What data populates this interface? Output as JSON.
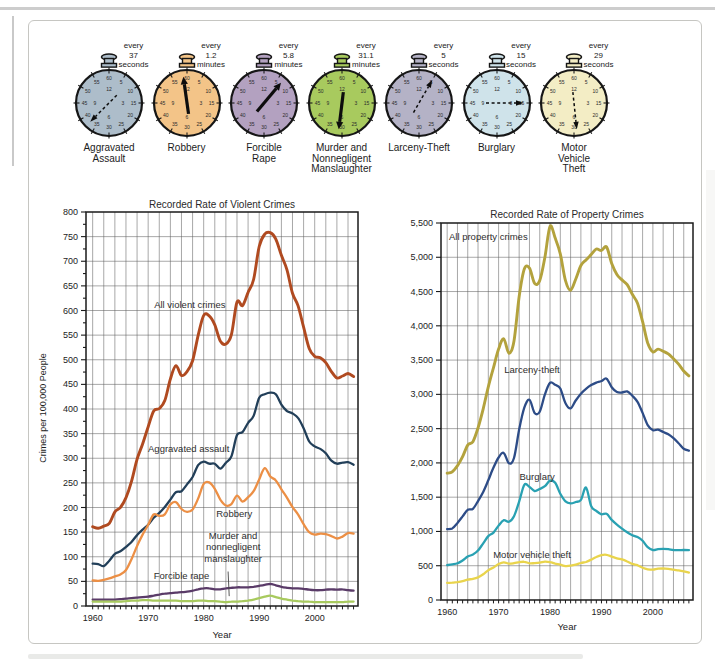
{
  "figure": {
    "name": "Crime clocks and recorded crime rate trends",
    "clocks": [
      {
        "interval": [
          "every",
          "37",
          "seconds"
        ],
        "label": [
          "Aggravated",
          "Assault"
        ],
        "color": "#adbdca",
        "arrow_deg": 225,
        "arrow_style": "dashed"
      },
      {
        "interval": [
          "every",
          "1.2",
          "minutes"
        ],
        "label": [
          "Robbery"
        ],
        "color": "#f3c488",
        "arrow_deg": -8,
        "arrow_style": "solid"
      },
      {
        "interval": [
          "every",
          "5.8",
          "minutes"
        ],
        "label": [
          "Forcible",
          "Rape"
        ],
        "color": "#b3a1c0",
        "arrow_deg": 40,
        "arrow_style": "solid"
      },
      {
        "interval": [
          "every",
          "31.1",
          "minutes"
        ],
        "label": [
          "Murder and",
          "Nonnegligent",
          "Manslaughter"
        ],
        "color": "#a8ca5e",
        "arrow_deg": 187,
        "arrow_style": "solid"
      },
      {
        "interval": [
          "every",
          "5",
          "seconds"
        ],
        "label": [
          "Larceny-Theft"
        ],
        "color": "#b4b2c6",
        "arrow_deg": 30,
        "arrow_style": "dashed"
      },
      {
        "interval": [
          "every",
          "15",
          "seconds"
        ],
        "label": [
          "Burglary"
        ],
        "color": "#cfe3ea",
        "arrow_deg": 90,
        "arrow_style": "dashed"
      },
      {
        "interval": [
          "every",
          "29",
          "seconds"
        ],
        "label": [
          "Motor",
          "Vehicle",
          "Theft"
        ],
        "color": "#f3edc5",
        "arrow_deg": 174,
        "arrow_style": "dashed"
      }
    ],
    "clock_dial": {
      "outer": [
        "60",
        "5",
        "10",
        "15",
        "20",
        "25",
        "30",
        "35",
        "40",
        "45",
        "50",
        "55"
      ],
      "inner": [
        "12",
        "3",
        "6",
        "9"
      ]
    }
  },
  "chart_data": [
    {
      "type": "line",
      "title": "Recorded Rate of Violent Crimes",
      "xlabel": "Year",
      "ylabel": "Crimes per 100,000 People",
      "x_start": 1960,
      "x_end": 2007,
      "xticks": [
        1960,
        1970,
        1980,
        1990,
        2000
      ],
      "ylim": [
        0,
        800
      ],
      "ytick": 50,
      "grid_x_step": 2,
      "series": [
        {
          "name": "All violent crimes",
          "color": "#b04a20",
          "values": [
            161,
            158,
            162,
            168,
            191,
            200,
            220,
            253,
            298,
            329,
            364,
            396,
            401,
            417,
            461,
            488,
            468,
            476,
            498,
            549,
            590,
            589,
            571,
            538,
            532,
            551,
            617,
            610,
            637,
            663,
            730,
            755,
            758,
            745,
            712,
            683,
            635,
            610,
            566,
            523,
            507,
            504,
            494,
            476,
            463,
            467,
            472,
            466
          ]
        },
        {
          "name": "Aggravated assault",
          "color": "#223f59",
          "values": [
            86,
            85,
            81,
            92,
            106,
            111,
            120,
            130,
            144,
            155,
            165,
            179,
            189,
            201,
            216,
            231,
            233,
            247,
            262,
            286,
            293,
            289,
            289,
            279,
            291,
            304,
            347,
            353,
            372,
            386,
            423,
            430,
            433,
            430,
            409,
            396,
            391,
            382,
            361,
            334,
            324,
            319,
            310,
            295,
            289,
            291,
            292,
            287
          ]
        },
        {
          "name": "Robbery",
          "color": "#ec8f45",
          "values": [
            52,
            51,
            53,
            56,
            60,
            64,
            73,
            95,
            122,
            145,
            165,
            186,
            183,
            186,
            206,
            211,
            197,
            191,
            196,
            218,
            248,
            251,
            238,
            216,
            204,
            207,
            224,
            212,
            221,
            233,
            257,
            280,
            263,
            255,
            237,
            220,
            201,
            186,
            166,
            150,
            145,
            147,
            146,
            142,
            137,
            141,
            148,
            147
          ]
        },
        {
          "name": "Forcible rape",
          "color": "#5a3b68",
          "values": [
            13,
            13,
            13,
            13,
            13,
            14,
            15,
            16,
            17,
            18,
            19,
            21,
            23,
            25,
            26,
            27,
            28,
            29,
            31,
            34,
            36,
            36,
            34,
            34,
            36,
            37,
            38,
            38,
            38,
            39,
            41,
            43,
            45,
            42,
            39,
            37,
            36,
            36,
            35,
            33,
            32,
            32,
            33,
            34,
            33,
            34,
            32,
            31
          ]
        },
        {
          "name": "Murder and nonnegligent manslaughter",
          "color": "#a8ca5e",
          "values": [
            9,
            9,
            9,
            9,
            9,
            9,
            10,
            11,
            11,
            12,
            12,
            11,
            11,
            11,
            11,
            11,
            10,
            10,
            10,
            11,
            11,
            10,
            10,
            9,
            8,
            9,
            9,
            10,
            11,
            13,
            16,
            19,
            21,
            18,
            15,
            13,
            11,
            10,
            9,
            9,
            8,
            8,
            8,
            8,
            8,
            8,
            9,
            9
          ]
        }
      ],
      "labels": [
        {
          "text": "All violent crimes",
          "x": 1977.5,
          "y": 612
        },
        {
          "text": "Aggravated assault",
          "x": 1977.3,
          "y": 318
        },
        {
          "text": "Robbery",
          "x": 1985.5,
          "y": 186
        },
        {
          "text": "Murder and",
          "x": 1985.3,
          "y": 142
        },
        {
          "text": "nonnegligent",
          "x": 1985.3,
          "y": 119
        },
        {
          "text": "manslaughter",
          "x": 1985.3,
          "y": 96
        },
        {
          "text": "Forcible rape",
          "x": 1976,
          "y": 60
        }
      ],
      "leader_line": {
        "x1": 1984.4,
        "y1": 70,
        "x2": 1984.6,
        "y2": 20
      }
    },
    {
      "type": "line",
      "title": "Recorded Rate of Property Crimes",
      "xlabel": "Year",
      "ylabel": "",
      "x_start": 1960,
      "x_end": 2007,
      "xticks": [
        1960,
        1970,
        1980,
        1990,
        2000
      ],
      "ylim": [
        0,
        5500
      ],
      "ytick": 500,
      "grid_x_step": 2,
      "series": [
        {
          "name": "All property crimes",
          "color": "#b3a23d",
          "values": [
            1850,
            1870,
            1960,
            2090,
            2260,
            2310,
            2510,
            2790,
            3110,
            3390,
            3660,
            3810,
            3600,
            3780,
            4430,
            4830,
            4840,
            4620,
            4660,
            5000,
            5450,
            5280,
            5050,
            4660,
            4520,
            4680,
            4880,
            4960,
            5040,
            5120,
            5100,
            5150,
            4910,
            4750,
            4670,
            4600,
            4460,
            4330,
            4060,
            3750,
            3620,
            3660,
            3630,
            3590,
            3520,
            3440,
            3340,
            3270
          ]
        },
        {
          "name": "Larceny-theft",
          "color": "#2d4c87",
          "values": [
            1035,
            1045,
            1125,
            1220,
            1316,
            1330,
            1443,
            1576,
            1747,
            1931,
            2079,
            2146,
            1994,
            2072,
            2490,
            2805,
            2921,
            2730,
            2747,
            3000,
            3167,
            3140,
            3085,
            2871,
            2795,
            2911,
            3010,
            3081,
            3135,
            3171,
            3195,
            3229,
            3104,
            3034,
            3027,
            3043,
            2980,
            2892,
            2730,
            2551,
            2477,
            2486,
            2451,
            2417,
            2362,
            2288,
            2207,
            2178
          ]
        },
        {
          "name": "Burglary",
          "color": "#29a1b2",
          "values": [
            509,
            519,
            535,
            576,
            635,
            663,
            721,
            827,
            932,
            984,
            1085,
            1164,
            1141,
            1223,
            1438,
            1680,
            1650,
            1590,
            1620,
            1660,
            1740,
            1710,
            1550,
            1440,
            1410,
            1430,
            1460,
            1640,
            1370,
            1300,
            1250,
            1258,
            1168,
            1100,
            1042,
            987,
            945,
            919,
            863,
            770,
            729,
            742,
            747,
            741,
            730,
            727,
            729,
            727
          ]
        },
        {
          "name": "Motor vehicle theft",
          "color": "#e9d44c",
          "values": [
            250,
            253,
            260,
            275,
            298,
            308,
            330,
            375,
            435,
            475,
            525,
            550,
            530,
            538,
            552,
            558,
            535,
            538,
            545,
            560,
            552,
            530,
            515,
            495,
            500,
            515,
            540,
            555,
            590,
            628,
            655,
            660,
            633,
            608,
            592,
            562,
            527,
            507,
            470,
            448,
            442,
            458,
            462,
            455,
            442,
            432,
            418,
            400
          ]
        }
      ],
      "labels": [
        {
          "text": "All property crimes",
          "x": 1968,
          "y": 5290
        },
        {
          "text": "Larceny-theft",
          "x": 1976.5,
          "y": 3360
        },
        {
          "text": "Burglary",
          "x": 1977.5,
          "y": 1800
        },
        {
          "text": "Motor vehicle theft",
          "x": 1976.5,
          "y": 660
        }
      ]
    }
  ]
}
